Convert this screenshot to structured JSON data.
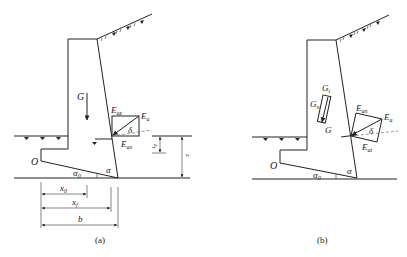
{
  "figure_a": {
    "caption": "(a)",
    "labels": {
      "G": "G",
      "Eaz": "E",
      "Eaz_sub": "az",
      "Ea": "E",
      "Ea_sub": "a",
      "Eax": "E",
      "Eax_sub": "ax",
      "delta": "δ",
      "alpha": "α",
      "alpha0": "α",
      "alpha0_sub": "0",
      "O": "O",
      "zf": "z",
      "zf_sub": "f",
      "z": "z",
      "z_sub": "",
      "x0": "x",
      "x0_sub": "0",
      "xf": "x",
      "xf_sub": "f",
      "b": "b"
    }
  },
  "figure_b": {
    "caption": "(b)",
    "labels": {
      "Gt": "G",
      "Gt_sub": "t",
      "Gn": "G",
      "Gn_sub": "n",
      "G": "G",
      "Ean": "E",
      "Ean_sub": "an",
      "Ea": "E",
      "Ea_sub": "a",
      "Eat": "E",
      "Eat_sub": "at",
      "delta": "δ",
      "alpha": "α",
      "alpha0": "α",
      "alpha0_sub": "0",
      "O": "O"
    }
  }
}
